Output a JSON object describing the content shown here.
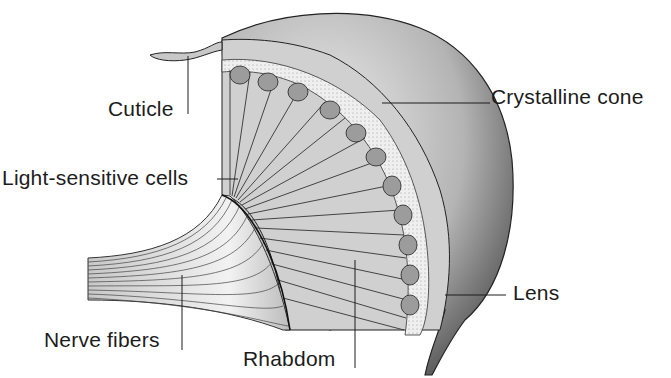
{
  "diagram": {
    "colors": {
      "ink": "#1c1c1c",
      "shade_dark": "#5a5a5a",
      "shade_mid": "#9a9a9a",
      "shade_light": "#d4d4d4",
      "background": "#ffffff"
    },
    "labels": [
      {
        "id": "cuticle",
        "text": "Cuticle"
      },
      {
        "id": "light-sensitive-cells",
        "text": "Light-sensitive cells"
      },
      {
        "id": "crystalline-cone",
        "text": "Crystalline cone"
      },
      {
        "id": "lens",
        "text": "Lens"
      },
      {
        "id": "nerve-fibers",
        "text": "Nerve fibers"
      },
      {
        "id": "rhabdom",
        "text": "Rhabdom"
      }
    ]
  }
}
